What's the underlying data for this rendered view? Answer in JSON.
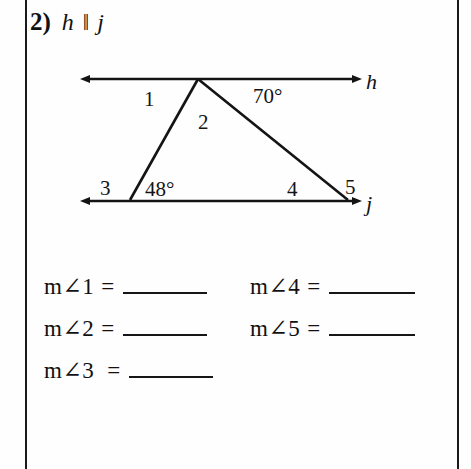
{
  "problem": {
    "number": "2)",
    "line_a": "h",
    "parallel_symbol": "‖",
    "line_b": "j"
  },
  "diagram": {
    "line_h_label": "h",
    "line_j_label": "j",
    "angle_1": "1",
    "angle_2": "2",
    "angle_70": "70°",
    "angle_3": "3",
    "angle_48": "48°",
    "angle_4": "4",
    "angle_5": "5"
  },
  "answers": {
    "rows": [
      {
        "label": "m∠1",
        "equals": "=",
        "value": ""
      },
      {
        "label": "m∠2",
        "equals": "=",
        "value": ""
      },
      {
        "label": "m∠3",
        "equals": "=",
        "value": ""
      },
      {
        "label": "m∠4",
        "equals": "=",
        "value": ""
      },
      {
        "label": "m∠5",
        "equals": "=",
        "value": ""
      }
    ]
  },
  "colors": {
    "ink": "#141414",
    "paper": "#fefefe"
  }
}
